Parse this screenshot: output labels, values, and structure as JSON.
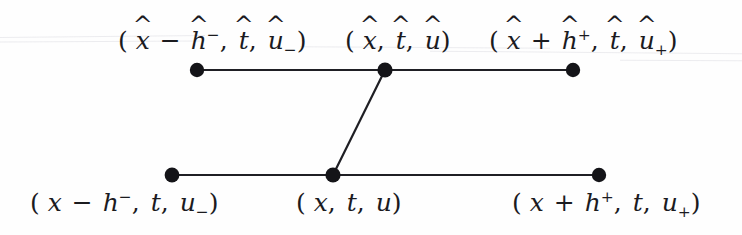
{
  "figure": {
    "kind": "two-level-stencil-diagram",
    "background_color": "#fefefe",
    "ink_color": "#1b1b1f",
    "node_color": "#141418",
    "node_radius": 7,
    "edge_width": 2,
    "artifact_color": "#e9e9ec"
  },
  "diagram_data": {
    "type": "diagram",
    "description": "Finite-difference stencil with an upper (hatted / new time) level of three nodes and a lower (unhatted / old time) level of three nodes; the two centre nodes are joined by a slanted segment.",
    "levels": [
      {
        "name": "upper-level",
        "id": "hatted",
        "y": 70,
        "nodes": [
          {
            "id": "upper-left",
            "x": 197,
            "y": 70,
            "label_id": "upper-left-label"
          },
          {
            "id": "upper-center",
            "x": 385,
            "y": 70,
            "label_id": "upper-center-label"
          },
          {
            "id": "upper-right",
            "x": 573,
            "y": 70,
            "label_id": "upper-right-label"
          }
        ]
      },
      {
        "name": "lower-level",
        "id": "unhatted",
        "y": 175,
        "nodes": [
          {
            "id": "lower-left",
            "x": 172,
            "y": 175,
            "label_id": "lower-left-label"
          },
          {
            "id": "lower-center",
            "x": 333,
            "y": 175,
            "label_id": "lower-center-label"
          },
          {
            "id": "lower-right",
            "x": 599,
            "y": 175,
            "label_id": "lower-right-label"
          }
        ]
      }
    ],
    "edges": [
      {
        "id": "upper-left-segment",
        "from": "upper-left",
        "to": "upper-center"
      },
      {
        "id": "upper-right-segment",
        "from": "upper-center",
        "to": "upper-right"
      },
      {
        "id": "lower-left-segment",
        "from": "lower-left",
        "to": "lower-center"
      },
      {
        "id": "lower-right-segment",
        "from": "lower-center",
        "to": "lower-right"
      },
      {
        "id": "center-connector",
        "from": "lower-center",
        "to": "upper-center"
      }
    ],
    "artifacts": [
      {
        "id": "artifact-top-left",
        "x": 0,
        "y": 36,
        "width": 205,
        "rotation": -0.6
      },
      {
        "id": "artifact-mid-left",
        "x": 0,
        "y": 41,
        "width": 200,
        "rotation": -0.3
      },
      {
        "id": "artifact-center",
        "x": 300,
        "y": 47,
        "width": 250,
        "rotation": 0.4
      },
      {
        "id": "artifact-right",
        "x": 430,
        "y": 52,
        "width": 312,
        "rotation": 0.5
      },
      {
        "id": "artifact-far-right",
        "x": 620,
        "y": 60,
        "width": 122,
        "rotation": 0.3
      }
    ]
  },
  "labels": {
    "upper_left": {
      "id": "upper-left-label",
      "text": "(x̂ − ĥ⁻, t̂, û₋)",
      "x": 118,
      "y": 28,
      "tokens": {
        "open": "(",
        "var1": "x",
        "var1_hat": "^",
        "op": "−",
        "var2": "h",
        "var2_hat": "^",
        "var2_sup": "−",
        "comma1": ",",
        "var3": "t",
        "var3_hat": "^",
        "comma2": ",",
        "var4": "u",
        "var4_hat": "^",
        "var4_sub": "−",
        "close": ")"
      }
    },
    "upper_center": {
      "id": "upper-center-label",
      "text": "(x̂, t̂, û)",
      "x": 345,
      "y": 28,
      "tokens": {
        "open": "(",
        "var1": "x",
        "var1_hat": "^",
        "comma1": ",",
        "var2": "t",
        "var2_hat": "^",
        "comma2": ",",
        "var3": "u",
        "var3_hat": "^",
        "close": ")"
      }
    },
    "upper_right": {
      "id": "upper-right-label",
      "text": "(x̂ + ĥ⁺, t̂, û₊)",
      "x": 489,
      "y": 28,
      "tokens": {
        "open": "(",
        "var1": "x",
        "var1_hat": "^",
        "op": "+",
        "var2": "h",
        "var2_hat": "^",
        "var2_sup": "+",
        "comma1": ",",
        "var3": "t",
        "var3_hat": "^",
        "comma2": ",",
        "var4": "u",
        "var4_hat": "^",
        "var4_sub": "+",
        "close": ")"
      }
    },
    "lower_left": {
      "id": "lower-left-label",
      "text": "(x − h⁻, t, u₋)",
      "x": 30,
      "y": 190,
      "tokens": {
        "open": "(",
        "var1": "x",
        "op": "−",
        "var2": "h",
        "var2_sup": "−",
        "comma1": ",",
        "var3": "t",
        "comma2": ",",
        "var4": "u",
        "var4_sub": "−",
        "close": ")"
      }
    },
    "lower_center": {
      "id": "lower-center-label",
      "text": "(x, t, u)",
      "x": 296,
      "y": 190,
      "tokens": {
        "open": "(",
        "var1": "x",
        "comma1": ",",
        "var2": "t",
        "comma2": ",",
        "var3": "u",
        "close": ")"
      }
    },
    "lower_right": {
      "id": "lower-right-label",
      "text": "(x + h⁺, t, u₊)",
      "x": 512,
      "y": 190,
      "tokens": {
        "open": "(",
        "var1": "x",
        "op": "+",
        "var2": "h",
        "var2_sup": "+",
        "comma1": ",",
        "var3": "t",
        "comma2": ",",
        "var4": "u",
        "var4_sub": "+",
        "close": ")"
      }
    }
  }
}
